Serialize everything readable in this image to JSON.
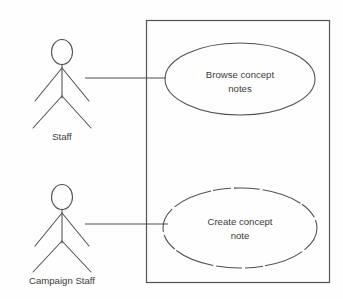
{
  "diagram": {
    "type": "uml-use-case-diagram",
    "background_color": "#fefefe",
    "line_color": "#4f4f4f",
    "text_color": "#3b3b3b",
    "system_boundary": {
      "label": "",
      "x": 146,
      "y": 20,
      "width": 184,
      "height": 263
    },
    "actors": [
      {
        "id": "staff",
        "label": "Staff",
        "x": 62,
        "y": 78,
        "label_x": 62,
        "label_y": 137
      },
      {
        "id": "campaign-staff",
        "label": "Campaign Staff",
        "x": 62,
        "y": 224,
        "label_x": 62,
        "label_y": 281
      }
    ],
    "use_cases": [
      {
        "id": "browse-concept-notes",
        "label_lines": [
          "Browse concept",
          "notes"
        ],
        "line1": "Browse concept",
        "line2": "notes",
        "cx": 240,
        "cy": 79,
        "rx": 75,
        "ry": 36,
        "border_style": "solid"
      },
      {
        "id": "create-concept-note",
        "label_lines": [
          "Create concept",
          "note"
        ],
        "line1": "Create concept",
        "line2": "note",
        "cx": 240,
        "cy": 228,
        "rx": 77,
        "ry": 40,
        "border_style": "broken"
      }
    ],
    "associations": [
      {
        "id": "staff-to-browse",
        "from": "staff",
        "to": "browse-concept-notes",
        "x1": 85,
        "y1": 78,
        "x2": 166,
        "y2": 78
      },
      {
        "id": "campaign-staff-to-create",
        "from": "campaign-staff",
        "to": "create-concept-note",
        "x1": 85,
        "y1": 224,
        "x2": 168,
        "y2": 224
      }
    ]
  }
}
